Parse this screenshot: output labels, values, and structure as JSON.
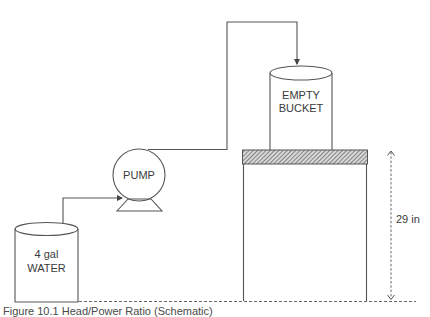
{
  "diagram": {
    "water_tank": {
      "line1": "4 gal",
      "line2": "WATER"
    },
    "pump": {
      "label": "PUMP"
    },
    "bucket": {
      "line1": "EMPTY",
      "line2": "BUCKET"
    },
    "dimension": {
      "label": "29 in"
    },
    "caption": "Figure 10.1  Head/Power Ratio (Schematic)"
  },
  "colors": {
    "line": "#555555",
    "text": "#3a3a3a",
    "background": "#ffffff"
  }
}
